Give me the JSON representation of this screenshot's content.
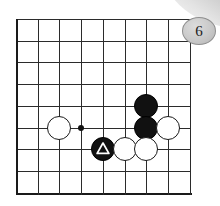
{
  "diagram": {
    "board": {
      "columns": 9,
      "rows": 9,
      "origin_x": 16,
      "origin_y": 19,
      "cell": 21.7,
      "line_color": "#2b2b2b",
      "edge_color": "#1a1a1a",
      "background_color": "#ffffff"
    },
    "star_points": [
      {
        "name": "hoshi-center-left",
        "col": 3,
        "row": 5
      }
    ],
    "stones": [
      {
        "name": "white-stone-c2r5",
        "color": "white",
        "col": 2,
        "row": 5,
        "marker": "none",
        "label": ""
      },
      {
        "name": "black-stone-c6r4",
        "color": "black",
        "col": 6,
        "row": 4,
        "marker": "none",
        "label": ""
      },
      {
        "name": "black-stone-c6r5",
        "color": "black",
        "col": 6,
        "row": 5,
        "marker": "none",
        "label": ""
      },
      {
        "name": "white-stone-c7r5",
        "color": "white",
        "col": 7,
        "row": 5,
        "marker": "none",
        "label": ""
      },
      {
        "name": "black-stone-c4r6-triangle",
        "color": "black",
        "col": 4,
        "row": 6,
        "marker": "triangle",
        "label": ""
      },
      {
        "name": "white-stone-c5r6",
        "color": "white",
        "col": 5,
        "row": 6,
        "marker": "none",
        "label": ""
      },
      {
        "name": "white-stone-c6r6",
        "color": "white",
        "col": 6,
        "row": 6,
        "marker": "none",
        "label": ""
      }
    ],
    "badge": {
      "label": "6",
      "x": 182,
      "y": 17,
      "width": 32,
      "height": 26,
      "fill_color": "#c9c9c9",
      "text_color": "#1b1b1b"
    },
    "corner_fold": {
      "name": "page-corner-fold",
      "color": "#b4b4b4"
    }
  }
}
